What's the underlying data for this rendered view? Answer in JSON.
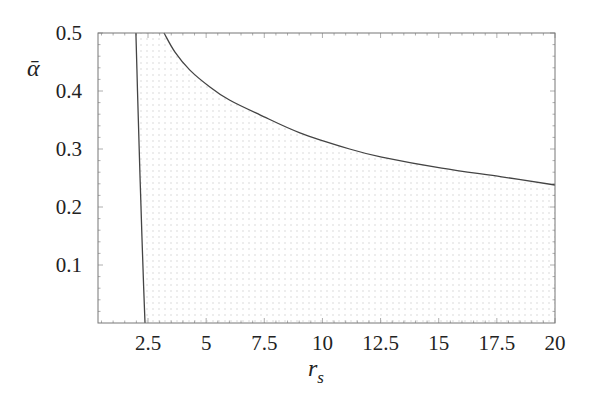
{
  "chart_data": {
    "type": "line",
    "title": "",
    "xlabel": "r_s",
    "ylabel": "ᾱ",
    "xlim": [
      0.35,
      20
    ],
    "ylim": [
      0,
      0.5
    ],
    "x_ticks": [
      2.5,
      5,
      7.5,
      10,
      12.5,
      15,
      17.5,
      20
    ],
    "x_tick_labels": [
      "2.5",
      "5",
      "7.5",
      "10",
      "12.5",
      "15",
      "17.5",
      "20"
    ],
    "y_ticks": [
      0.1,
      0.2,
      0.3,
      0.4,
      0.5
    ],
    "y_tick_labels": [
      "0.1",
      "0.2",
      "0.3",
      "0.4",
      "0.5"
    ],
    "grid": false,
    "legend": null,
    "shaded_region": {
      "description": "dotted light-gray region bounded by left curve, upper curve, bottom axis and right frame",
      "fill": "#d8d8d8"
    },
    "series": [
      {
        "name": "left-boundary",
        "color": "#444444",
        "x": [
          1.98,
          2.05,
          2.12,
          2.2,
          2.28,
          2.37
        ],
        "y": [
          0.5,
          0.4,
          0.3,
          0.2,
          0.1,
          0.0
        ]
      },
      {
        "name": "upper-boundary",
        "color": "#444444",
        "x": [
          3.19,
          3.66,
          4.3,
          5.16,
          6.02,
          7.31,
          9.03,
          11.17,
          12.55,
          15.13,
          17.71,
          20.0
        ],
        "y": [
          0.5,
          0.467,
          0.436,
          0.407,
          0.384,
          0.359,
          0.328,
          0.3,
          0.286,
          0.267,
          0.252,
          0.238
        ]
      }
    ]
  },
  "labels": {
    "x_axis": "r",
    "x_axis_sub": "s",
    "y_axis": "ᾱ"
  }
}
